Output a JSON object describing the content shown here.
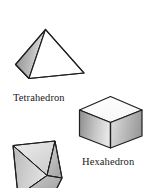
{
  "figure": {
    "title_visible": false,
    "background_color": "#ffffff",
    "stroke_color": "#1a1a1a",
    "labels": {
      "tetrahedron": "Tetrahedron",
      "hexahedron": "Hexahedron"
    },
    "shapes": [
      {
        "name": "tetrahedron",
        "label": "Tetrahedron",
        "faces_visible": 3,
        "shading": [
          "dark-gray-gradient",
          "light-gray-gradient",
          "white"
        ],
        "colors": {
          "left_face_dark": "#7a7a7a",
          "left_face_light": "#d8d8d8",
          "mid_face_light": "#f2f2f2",
          "right_face": "#ffffff"
        }
      },
      {
        "name": "hexahedron",
        "label": "Hexahedron",
        "faces_visible": 3,
        "shading": [
          "white-top",
          "gray-gradient-left",
          "gray-gradient-right"
        ],
        "colors": {
          "top_face": "#fdfdfd",
          "left_face_dark": "#8d8d8d",
          "left_face_light": "#e6e6e6",
          "right_face_dark": "#9a9a9a",
          "right_face_light": "#dcdcdc"
        }
      },
      {
        "name": "octahedron",
        "label": "",
        "clipped": true,
        "faces_visible": 4,
        "shading": [
          "gray-gradient",
          "light-gray",
          "mid-gray",
          "dark-gray"
        ],
        "colors": {
          "face_a": "#cfcfcf",
          "face_b": "#e4e4e4",
          "face_c": "#b8b8b8",
          "face_d": "#a5a5a5"
        }
      }
    ]
  }
}
